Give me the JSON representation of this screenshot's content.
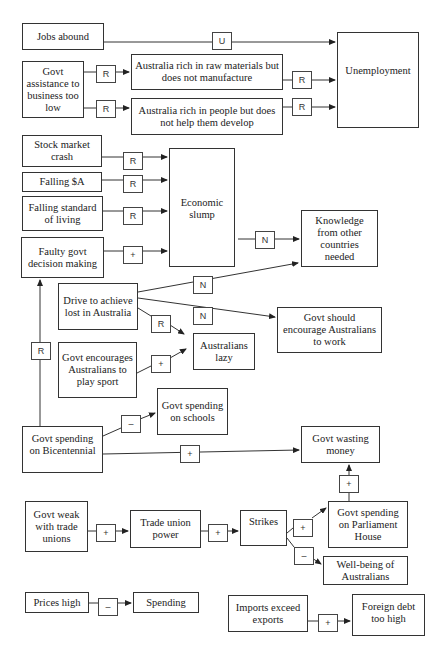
{
  "diagram": {
    "type": "causal-map",
    "nodes": {
      "jobs_abound": "Jobs abound",
      "govt_assistance": "Govt assistance to business too low",
      "raw_materials": "Australia rich in raw materials but does not manufacture",
      "rich_people": "Australia rich in people but does not help them develop",
      "unemployment": "Unemployment",
      "stock_crash": "Stock market crash",
      "falling_a": "Falling $A",
      "falling_living": "Falling standard of living",
      "faulty_govt": "Faulty govt decision making",
      "economic_slump": "Economic slump",
      "knowledge_needed": "Knowledge from other countries needed",
      "drive_lost": "Drive to achieve lost in Australia",
      "govt_should_encourage": "Govt should encourage Australians to work",
      "govt_encourages_sport": "Govt encourages Australians to play sport",
      "australians_lazy": "Australians lazy",
      "govt_schools": "Govt spending on schools",
      "govt_bicentennial": "Govt spending on Bicentennial",
      "govt_wasting": "Govt wasting money",
      "govt_weak_unions": "Govt weak with trade unions",
      "trade_union_power": "Trade union power",
      "strikes": "Strikes",
      "govt_parliament": "Govt spending on Parliament House",
      "wellbeing": "Well-being of Australians",
      "prices_high": "Prices high",
      "spending": "Spending",
      "imports_exceed": "Imports exceed exports",
      "foreign_debt": "Foreign debt too high"
    },
    "edges": [
      {
        "from": "jobs_abound",
        "to": "unemployment",
        "label": "U"
      },
      {
        "from": "govt_assistance",
        "to": "raw_materials",
        "label": "R"
      },
      {
        "from": "govt_assistance",
        "to": "rich_people",
        "label": "R"
      },
      {
        "from": "raw_materials",
        "to": "unemployment",
        "label": "R"
      },
      {
        "from": "rich_people",
        "to": "unemployment",
        "label": "R"
      },
      {
        "from": "stock_crash",
        "to": "economic_slump",
        "label": "R"
      },
      {
        "from": "falling_a",
        "to": "economic_slump",
        "label": "R"
      },
      {
        "from": "falling_living",
        "to": "economic_slump",
        "label": "R"
      },
      {
        "from": "faulty_govt",
        "to": "economic_slump",
        "label": "+"
      },
      {
        "from": "economic_slump",
        "to": "knowledge_needed",
        "label": "N"
      },
      {
        "from": "drive_lost",
        "to": "knowledge_needed",
        "label": "N"
      },
      {
        "from": "drive_lost",
        "to": "govt_should_encourage",
        "label": "N"
      },
      {
        "from": "drive_lost",
        "to": "australians_lazy",
        "label": "R"
      },
      {
        "from": "govt_encourages_sport",
        "to": "australians_lazy",
        "label": "+"
      },
      {
        "from": "govt_bicentennial",
        "to": "faulty_govt",
        "label": "R"
      },
      {
        "from": "govt_bicentennial",
        "to": "govt_schools",
        "label": "–"
      },
      {
        "from": "govt_bicentennial",
        "to": "govt_wasting",
        "label": "+"
      },
      {
        "from": "govt_parliament",
        "to": "govt_wasting",
        "label": "+"
      },
      {
        "from": "govt_weak_unions",
        "to": "trade_union_power",
        "label": "+"
      },
      {
        "from": "trade_union_power",
        "to": "strikes",
        "label": "+"
      },
      {
        "from": "strikes",
        "to": "govt_parliament",
        "label": "+"
      },
      {
        "from": "strikes",
        "to": "wellbeing",
        "label": "–"
      },
      {
        "from": "prices_high",
        "to": "spending",
        "label": "–"
      },
      {
        "from": "imports_exceed",
        "to": "foreign_debt",
        "label": "+"
      }
    ]
  },
  "colors": {
    "line": "#333333",
    "background": "#ffffff"
  }
}
